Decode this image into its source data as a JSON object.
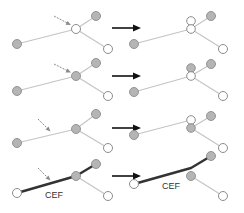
{
  "diagram": {
    "labels": {
      "row4_left": "CEF",
      "row4_right": "CEF"
    },
    "colors": {
      "node_gray": "#b5b5b5",
      "node_open": "#ffffff",
      "edge": "#c4c4c4",
      "cef_edge": "#333333",
      "arrow": "#111111"
    },
    "rows": [
      {
        "name": "row-1",
        "description": "center node open; split into two open nodes"
      },
      {
        "name": "row-2",
        "description": "center node gray; split into gray above open"
      },
      {
        "name": "row-3",
        "description": "center node gray; split into open above gray"
      },
      {
        "name": "row-4",
        "description": "CEF path highlighted; split with CEF routed through new node"
      }
    ]
  }
}
